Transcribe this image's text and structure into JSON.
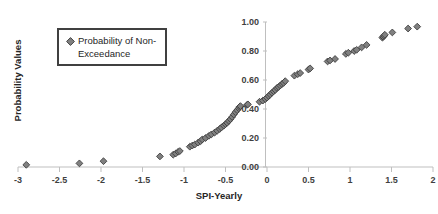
{
  "chart_data": {
    "type": "scatter",
    "title": "",
    "xlabel": "SPI-Yearly",
    "ylabel": "Probability Values",
    "xlim": [
      -3,
      2
    ],
    "ylim": [
      0.0,
      1.0
    ],
    "xticks": [
      -3,
      -2.5,
      -2,
      -1.5,
      -1,
      -0.5,
      0,
      0.5,
      1,
      1.5,
      2
    ],
    "xtick_labels": [
      "-3",
      "-2.5",
      "-2",
      "-1.5",
      "-1",
      "-0.5",
      "0",
      "0.5",
      "1",
      "1.5",
      "2"
    ],
    "yticks": [
      0.0,
      0.2,
      0.4,
      0.6,
      0.8,
      1.0
    ],
    "ytick_labels": [
      "0.00",
      "0.20",
      "0.40",
      "0.60",
      "0.80",
      "1.00"
    ],
    "grid": false,
    "legend_position": "upper-left",
    "marker": "diamond",
    "marker_color": "#808080",
    "marker_edge_color": "#404040",
    "axis_color": "#bfbfbf",
    "series": [
      {
        "name": "Probability of Non-Exceedance",
        "points": [
          [
            -2.9,
            0.015
          ],
          [
            -2.26,
            0.025
          ],
          [
            -1.97,
            0.04
          ],
          [
            -1.29,
            0.073
          ],
          [
            -1.13,
            0.085
          ],
          [
            -1.1,
            0.093
          ],
          [
            -1.07,
            0.105
          ],
          [
            -1.05,
            0.11
          ],
          [
            -0.93,
            0.14
          ],
          [
            -0.9,
            0.148
          ],
          [
            -0.87,
            0.155
          ],
          [
            -0.83,
            0.168
          ],
          [
            -0.8,
            0.178
          ],
          [
            -0.78,
            0.19
          ],
          [
            -0.74,
            0.2
          ],
          [
            -0.7,
            0.215
          ],
          [
            -0.67,
            0.225
          ],
          [
            -0.63,
            0.238
          ],
          [
            -0.6,
            0.25
          ],
          [
            -0.57,
            0.262
          ],
          [
            -0.55,
            0.272
          ],
          [
            -0.52,
            0.285
          ],
          [
            -0.5,
            0.295
          ],
          [
            -0.48,
            0.305
          ],
          [
            -0.46,
            0.318
          ],
          [
            -0.44,
            0.33
          ],
          [
            -0.42,
            0.345
          ],
          [
            -0.4,
            0.362
          ],
          [
            -0.38,
            0.378
          ],
          [
            -0.36,
            0.392
          ],
          [
            -0.34,
            0.405
          ],
          [
            -0.33,
            0.415
          ],
          [
            -0.32,
            0.42
          ],
          [
            -0.24,
            0.428
          ],
          [
            -0.23,
            0.432
          ],
          [
            -0.09,
            0.45
          ],
          [
            -0.05,
            0.458
          ],
          [
            -0.02,
            0.468
          ],
          [
            0.0,
            0.478
          ],
          [
            0.02,
            0.49
          ],
          [
            0.04,
            0.5
          ],
          [
            0.06,
            0.512
          ],
          [
            0.08,
            0.522
          ],
          [
            0.1,
            0.532
          ],
          [
            0.12,
            0.545
          ],
          [
            0.14,
            0.552
          ],
          [
            0.16,
            0.562
          ],
          [
            0.18,
            0.572
          ],
          [
            0.2,
            0.58
          ],
          [
            0.22,
            0.592
          ],
          [
            0.33,
            0.63
          ],
          [
            0.37,
            0.64
          ],
          [
            0.4,
            0.648
          ],
          [
            0.5,
            0.672
          ],
          [
            0.52,
            0.68
          ],
          [
            0.73,
            0.728
          ],
          [
            0.76,
            0.735
          ],
          [
            0.82,
            0.745
          ],
          [
            0.95,
            0.78
          ],
          [
            0.98,
            0.788
          ],
          [
            1.05,
            0.8
          ],
          [
            1.08,
            0.808
          ],
          [
            1.14,
            0.825
          ],
          [
            1.2,
            0.842
          ],
          [
            1.39,
            0.892
          ],
          [
            1.4,
            0.898
          ],
          [
            1.41,
            0.905
          ],
          [
            1.42,
            0.912
          ],
          [
            1.51,
            0.928
          ],
          [
            1.7,
            0.955
          ],
          [
            1.81,
            0.968
          ]
        ]
      }
    ]
  },
  "legend": {
    "label": "Probability of Non-Exceedance",
    "marker_name": "diamond-marker"
  }
}
